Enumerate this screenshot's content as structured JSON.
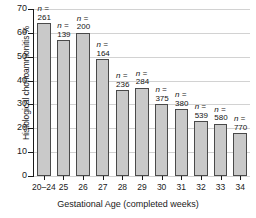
{
  "chart_data": {
    "type": "bar",
    "title": "",
    "xlabel": "Gestational Age (completed weeks)",
    "ylabel": "Histological chorioamnionitis %",
    "ylim": [
      0,
      70
    ],
    "ytick_labels": [
      "0",
      "10",
      "20",
      "30",
      "40",
      "50",
      "60",
      "70"
    ],
    "yticks": [
      0,
      10,
      20,
      30,
      40,
      50,
      60,
      70
    ],
    "grid": true,
    "legend": "none",
    "categories": [
      "20–24",
      "25",
      "26",
      "27",
      "28",
      "29",
      "30",
      "31",
      "32",
      "33",
      "34"
    ],
    "values": [
      64,
      57,
      60,
      49,
      36,
      37,
      30,
      28,
      23,
      22,
      18
    ],
    "point_labels": [
      "261",
      "139",
      "200",
      "164",
      "236",
      "284",
      "375",
      "380",
      "539",
      "580",
      "770"
    ],
    "point_label_prefix": "n =",
    "bar_color": "#c9c9c9",
    "bar_border_color": "#4a4a4a",
    "grid_color": "#d2d2d2",
    "axis_color": "#1a1a1a"
  }
}
